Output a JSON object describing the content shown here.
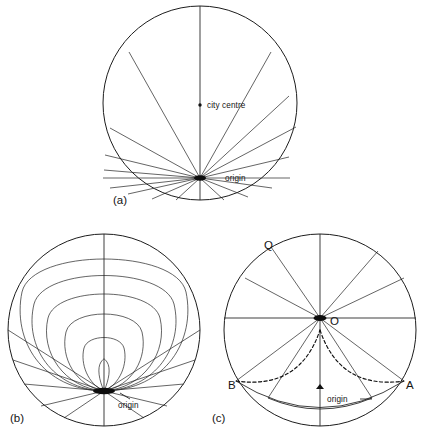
{
  "figure": {
    "type": "diagram",
    "panels": [
      {
        "key": "a",
        "panel_label": "(a)",
        "cx": 200,
        "cy": 103,
        "r": 97,
        "origin": {
          "x": 200,
          "y": 178,
          "label": "origin"
        },
        "annotations": [
          {
            "name": "city-centre",
            "label": "city centre",
            "x": 200,
            "y": 105,
            "marker": "dot"
          },
          {
            "name": "origin",
            "label": "origin",
            "x": 200,
            "y": 178,
            "marker": "hub"
          }
        ],
        "spoke_angles_deg": [
          90,
          62,
          36,
          14,
          -4,
          -20,
          -38,
          -56,
          -74,
          -92,
          -110,
          -128,
          -146,
          -164,
          180,
          140,
          116
        ],
        "leader_lines": [
          {
            "from_x": 210,
            "from_y": 178,
            "to_x": 222,
            "to_y": 178
          },
          {
            "from_x": 248,
            "from_y": 178,
            "to_x": 288,
            "to_y": 178
          }
        ]
      },
      {
        "key": "b",
        "panel_label": "(b)",
        "cx": 104,
        "cy": 330,
        "r": 96,
        "origin": {
          "x": 104,
          "y": 391,
          "label": "origin"
        },
        "loop_count": 6,
        "loop_heights": [
          22,
          48,
          78,
          112,
          148,
          182
        ],
        "loop_widths": [
          10,
          30,
          56,
          84,
          112,
          140
        ],
        "spoke_angles_deg": [
          -90,
          -74,
          -58,
          -42,
          -26,
          -10,
          -106,
          -122,
          -138,
          -154,
          -170,
          180
        ],
        "annotations": [
          {
            "name": "origin",
            "label": "origin",
            "x": 104,
            "y": 391,
            "marker": "hub"
          }
        ]
      },
      {
        "key": "c",
        "panel_label": "(c)",
        "cx": 320,
        "cy": 330,
        "r": 96,
        "origin_point": {
          "x": 320,
          "y": 318,
          "label": "O"
        },
        "foot_point": {
          "x": 320,
          "y": 391,
          "label": "origin"
        },
        "annotations": [
          {
            "name": "point-q",
            "label": "Q",
            "x": 271,
            "y": 245
          },
          {
            "name": "point-o",
            "label": "O",
            "x": 333,
            "y": 320
          },
          {
            "name": "point-b",
            "label": "B",
            "x": 236,
            "y": 385
          },
          {
            "name": "point-a",
            "label": "A",
            "x": 404,
            "y": 385
          },
          {
            "name": "origin",
            "label": "origin",
            "x": 320,
            "y": 391
          }
        ],
        "spoke_angles_deg": [
          90,
          58,
          28,
          0,
          180,
          122,
          152,
          -32,
          -62,
          -90,
          -118,
          -148
        ],
        "solid_arc_label": "inner sector arc",
        "dashed_arc_label": "isochrone arc B to A"
      }
    ],
    "labels": {
      "city_centre": "city centre",
      "origin": "origin",
      "point_q": "Q",
      "point_o": "O",
      "point_a": "A",
      "point_b": "B",
      "panel_a": "(a)",
      "panel_b": "(b)",
      "panel_c": "(c)"
    },
    "colors": {
      "background": "#ffffff",
      "ink": "#1d1d1d",
      "hub": "#0d0d0d"
    }
  }
}
